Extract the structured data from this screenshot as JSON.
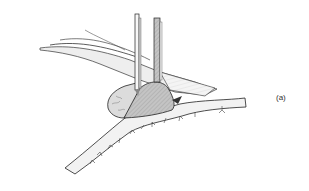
{
  "figure": {
    "panel_label": "(a)",
    "colors": {
      "background": "#ffffff",
      "line": "#222222",
      "shade_dark": "#b8b8b8",
      "shade_light": "#e2e2e2",
      "vessel_fill": "#f2f2f2"
    }
  }
}
